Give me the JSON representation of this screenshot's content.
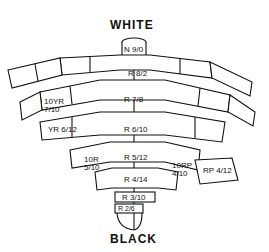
{
  "diagram": {
    "title_top": "WHITE",
    "title_bottom": "BLACK",
    "labels": [
      {
        "id": "n9",
        "text": "N 9/0"
      },
      {
        "id": "r8",
        "text": "R 8/2"
      },
      {
        "id": "r7",
        "text": "R 7/8"
      },
      {
        "id": "yr10",
        "text": "10YR 7/10"
      },
      {
        "id": "yr6",
        "text": "YR 6/12"
      },
      {
        "id": "r6",
        "text": "R 6/10"
      },
      {
        "id": "r5",
        "text": "R 5/12"
      },
      {
        "id": "r10",
        "text": "10R 5/10"
      },
      {
        "id": "rp10",
        "text": "10RP 4/10"
      },
      {
        "id": "rp4",
        "text": "RP 4/12"
      },
      {
        "id": "r4",
        "text": "R 4/14"
      },
      {
        "id": "r3",
        "text": "R 3/10"
      },
      {
        "id": "r2",
        "text": "R 2/6"
      }
    ]
  }
}
